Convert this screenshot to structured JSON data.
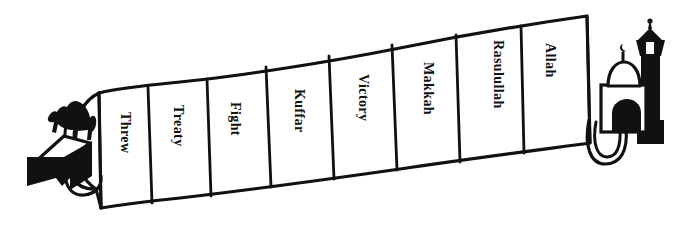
{
  "diagram": {
    "style": "hand-drawn black ink on white",
    "colors": {
      "ink": "#111111",
      "paper": "#ffffff",
      "fill_black": "#111111"
    },
    "left_icon": {
      "name": "camel-and-tent",
      "parts": [
        "camel-icon",
        "tent-icon",
        "rope-loop-icon"
      ],
      "label": "Desert tent with camel"
    },
    "right_icon": {
      "name": "mosque-with-minaret",
      "parts": [
        "minaret-icon",
        "dome-icon",
        "crescent-finial-icon",
        "arch-door-icon",
        "rope-loop-icon"
      ],
      "label": "Mosque with minaret"
    },
    "banner": {
      "name": "segmented-banner",
      "segment_count": 8,
      "segments": [
        {
          "label": "Threw",
          "index": 1
        },
        {
          "label": "Treaty",
          "index": 2
        },
        {
          "label": "Fight",
          "index": 3
        },
        {
          "label": "Kuffar",
          "index": 4
        },
        {
          "label": "Victory",
          "index": 5
        },
        {
          "label": "Makkah",
          "index": 6
        },
        {
          "label": "Rasulullah",
          "index": 7
        },
        {
          "label": "Allah",
          "index": 8
        }
      ],
      "text_orientation": "rotated 90 degrees clockwise (top-to-bottom reading)"
    }
  }
}
